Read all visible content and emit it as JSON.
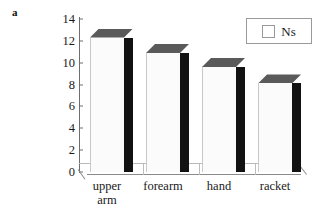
{
  "figure": {
    "panel_label": "a",
    "background_color": "#ffffff"
  },
  "legend": {
    "position": "top-right",
    "swatch_icon": "square-swatch-icon",
    "entries": [
      {
        "label": "Ns",
        "swatch_color": "#ffffff",
        "swatch_border": "#9a9a9a"
      }
    ]
  },
  "axis": {
    "y_ticks": [
      "0",
      "2",
      "4",
      "6",
      "8",
      "10",
      "12",
      "14"
    ],
    "y_min": 0,
    "y_max": 14,
    "y_step": 2
  },
  "bars": [
    {
      "label": "upper\narm",
      "value": 12.3,
      "front_color": "#fbfbfb",
      "side_color": "#121212",
      "top_color": "#5a5a5a"
    },
    {
      "label": "forearm",
      "value": 10.9,
      "front_color": "#fbfbfb",
      "side_color": "#121212",
      "top_color": "#5a5a5a"
    },
    {
      "label": "hand",
      "value": 9.6,
      "front_color": "#fbfbfb",
      "side_color": "#121212",
      "top_color": "#5a5a5a"
    },
    {
      "label": "racket",
      "value": 8.1,
      "front_color": "#fbfbfb",
      "side_color": "#121212",
      "top_color": "#5a5a5a"
    }
  ],
  "chart_data": {
    "type": "bar",
    "title": "",
    "subtitle": "",
    "xlabel": "",
    "ylabel": "",
    "categories": [
      "upper arm",
      "forearm",
      "hand",
      "racket"
    ],
    "series": [
      {
        "name": "Ns",
        "values": [
          12.3,
          10.9,
          9.6,
          8.1
        ]
      }
    ],
    "values": [
      12.3,
      10.9,
      9.6,
      8.1
    ],
    "ylim": [
      0,
      14
    ],
    "ytick_step": 2,
    "yticks": [
      0,
      2,
      4,
      6,
      8,
      10,
      12,
      14
    ],
    "grid": false,
    "legend": [
      "Ns"
    ],
    "legend_position": "top-right",
    "style": "3d-column",
    "panel_label": "a",
    "annotations": []
  }
}
